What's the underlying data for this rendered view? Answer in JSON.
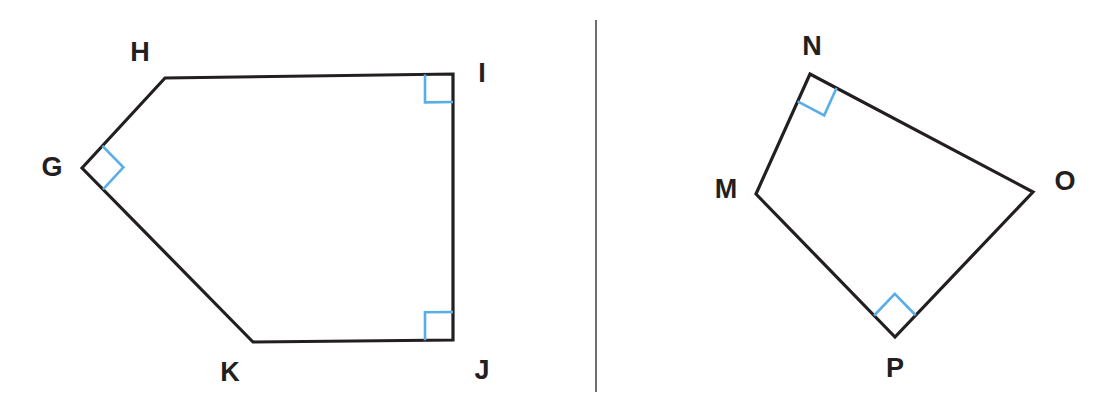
{
  "canvas": {
    "width": 1112,
    "height": 418,
    "background": "#ffffff",
    "stroke_color": "#231f20",
    "right_angle_color": "#5aaee6",
    "divider_color": "#6d6e71"
  },
  "divider": {
    "name": "vertical-divider",
    "x": 596,
    "y1": 20,
    "y2": 392
  },
  "figures": [
    {
      "id": "figure-left",
      "name": "pentagon-ghijk",
      "shape": "pentagon",
      "vertices": [
        {
          "label": "G",
          "x": 82,
          "y": 168,
          "label_x": 52,
          "label_y": 167,
          "right_angle": true
        },
        {
          "label": "H",
          "x": 165,
          "y": 78,
          "label_x": 140,
          "label_y": 52,
          "right_angle": false
        },
        {
          "label": "I",
          "x": 453,
          "y": 74,
          "label_x": 482,
          "label_y": 73,
          "right_angle": true
        },
        {
          "label": "J",
          "x": 453,
          "y": 340,
          "label_x": 482,
          "label_y": 370,
          "right_angle": true
        },
        {
          "label": "K",
          "x": 253,
          "y": 342,
          "label_x": 230,
          "label_y": 372,
          "right_angle": false
        }
      ],
      "right_angle_marks": [
        {
          "at": "G",
          "size": 30
        },
        {
          "at": "I",
          "size": 28
        },
        {
          "at": "J",
          "size": 28
        }
      ]
    },
    {
      "id": "figure-right",
      "name": "quadrilateral-mnop",
      "shape": "quadrilateral",
      "vertices": [
        {
          "label": "M",
          "x": 756,
          "y": 194,
          "label_x": 726,
          "label_y": 189,
          "right_angle": false
        },
        {
          "label": "N",
          "x": 810,
          "y": 74,
          "label_x": 812,
          "label_y": 46,
          "right_angle": true
        },
        {
          "label": "O",
          "x": 1033,
          "y": 192,
          "label_x": 1065,
          "label_y": 181,
          "right_angle": false
        },
        {
          "label": "P",
          "x": 895,
          "y": 337,
          "label_x": 895,
          "label_y": 368,
          "right_angle": true
        }
      ],
      "right_angle_marks": [
        {
          "at": "N",
          "size": 30
        },
        {
          "at": "P",
          "size": 30
        }
      ]
    }
  ]
}
